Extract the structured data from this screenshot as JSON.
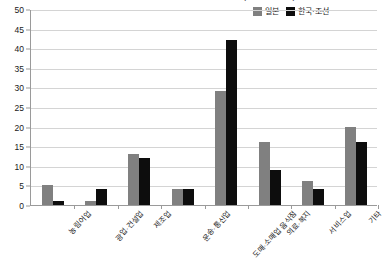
{
  "chart_data": {
    "type": "bar",
    "title": "〈그림 2〉 재일조선인 산업별 취업자 비율(2010년 기준)",
    "xlabel": "",
    "ylabel": "",
    "ylim": [
      0,
      50
    ],
    "ytick_step": 5,
    "yticks": [
      "0",
      "5",
      "10",
      "15",
      "20",
      "25",
      "30",
      "35",
      "40",
      "45",
      "50"
    ],
    "grid": true,
    "legend_position": "top-right",
    "categories": [
      "농림어업",
      "광업·건설업",
      "제조업",
      "운송·통신업",
      "도매·소매업 음식점",
      "의료·복지",
      "서비스업",
      "기타"
    ],
    "series": [
      {
        "name": "일본",
        "color": "#808080",
        "values": [
          5,
          1,
          13,
          4,
          29,
          16,
          6,
          20
        ]
      },
      {
        "name": "한국·조선",
        "color": "#0d0d0d",
        "values": [
          1,
          4,
          12,
          4,
          42,
          9,
          4,
          16
        ]
      }
    ]
  },
  "legend": {
    "items": [
      {
        "label": "일본",
        "color": "#808080"
      },
      {
        "label": "한국·조선",
        "color": "#0d0d0d"
      }
    ]
  }
}
